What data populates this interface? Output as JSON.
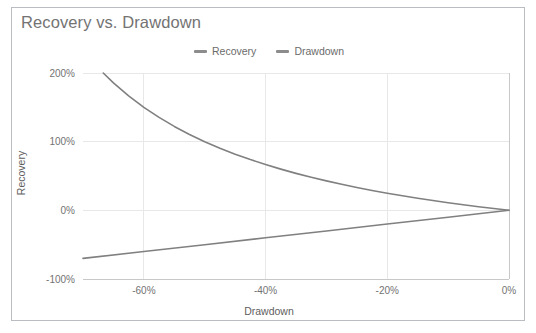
{
  "chart_data": {
    "type": "line",
    "title": "Recovery vs. Drawdown",
    "xlabel": "Drawdown",
    "ylabel": "Recovery",
    "xlim": [
      -0.7,
      0.0
    ],
    "ylim": [
      -1.0,
      2.0
    ],
    "grid": true,
    "legend_position": "top-center",
    "xticks": [
      "-60%",
      "-40%",
      "-20%",
      "0%"
    ],
    "xtick_values": [
      -0.6,
      -0.4,
      -0.2,
      0.0
    ],
    "yticks": [
      "200%",
      "100%",
      "0%",
      "-100%"
    ],
    "ytick_values": [
      2.0,
      1.0,
      0.0,
      -1.0
    ],
    "series": [
      {
        "name": "Recovery",
        "color": "#808080",
        "description": "Gain required to recover from a drawdown: r = -d/(1+d)",
        "x": [
          -0.6667,
          -0.65,
          -0.625,
          -0.6,
          -0.575,
          -0.55,
          -0.525,
          -0.5,
          -0.475,
          -0.45,
          -0.425,
          -0.4,
          -0.375,
          -0.35,
          -0.325,
          -0.3,
          -0.275,
          -0.25,
          -0.225,
          -0.2,
          -0.175,
          -0.15,
          -0.125,
          -0.1,
          -0.075,
          -0.05,
          -0.025,
          0.0
        ],
        "y": [
          2.0,
          1.857,
          1.667,
          1.5,
          1.353,
          1.222,
          1.105,
          1.0,
          0.905,
          0.818,
          0.739,
          0.667,
          0.6,
          0.538,
          0.481,
          0.429,
          0.379,
          0.333,
          0.29,
          0.25,
          0.212,
          0.176,
          0.143,
          0.111,
          0.081,
          0.053,
          0.026,
          0.0
        ]
      },
      {
        "name": "Drawdown",
        "color": "#808080",
        "description": "Identity line: the drawdown itself",
        "x": [
          -0.7,
          -0.6,
          -0.5,
          -0.4,
          -0.3,
          -0.2,
          -0.1,
          0.0
        ],
        "y": [
          -0.7,
          -0.6,
          -0.5,
          -0.4,
          -0.3,
          -0.2,
          -0.1,
          0.0
        ]
      }
    ]
  },
  "legend": {
    "items": [
      {
        "label": "Recovery"
      },
      {
        "label": "Drawdown"
      }
    ]
  },
  "colors": {
    "series": "#808080",
    "title": "#737373",
    "gridline": "#e8e8e8",
    "axis": "#c8c8c8",
    "frame_border": "#b9bcc0"
  }
}
